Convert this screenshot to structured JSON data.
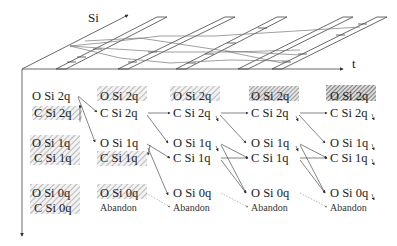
{
  "axes": {
    "vertical_top_label": "Si",
    "horizontal_label": "t"
  },
  "colors": {
    "line": "#333333",
    "hatch": "#9a9a9a",
    "hatch_dense": "#555555",
    "text": "#222222"
  },
  "columns": [
    {
      "index": 0,
      "row_2q": {
        "o": "O Si 2q",
        "c": "C Si 2q",
        "o_hatched": false,
        "c_hatched": true
      },
      "row_1q": {
        "o": "O Si 1q",
        "c": "C Si 1q",
        "o_hatched": true,
        "c_hatched": true
      },
      "row_0q": {
        "o": "O Si 0q",
        "c": "C Si 0q",
        "o_hatched": true,
        "c_hatched": true
      }
    },
    {
      "index": 1,
      "row_2q": {
        "o": "O Si 2q",
        "c": "C Si 2q",
        "o_hatched": true,
        "c_hatched": false
      },
      "row_1q": {
        "o": "O Si 1q",
        "c": "C Si 1q",
        "o_hatched": false,
        "c_hatched": true
      },
      "row_0q": {
        "o": "O Si 0q",
        "c": "Abandon",
        "o_hatched": true,
        "c_hatched": false
      }
    },
    {
      "index": 2,
      "row_2q": {
        "o": "O Si 2q",
        "c": "C Si 2q",
        "o_hatched": true,
        "c_hatched": false
      },
      "row_1q": {
        "o": "O Si 1q",
        "c": "C Si 1q",
        "o_hatched": false,
        "c_hatched": false
      },
      "row_0q": {
        "o": "O Si 0q",
        "c": "Abandon",
        "o_hatched": false,
        "c_hatched": false
      }
    },
    {
      "index": 3,
      "row_2q": {
        "o": "O Si 2q",
        "c": "C Si 2q",
        "o_hatched": true,
        "c_hatched": false
      },
      "row_1q": {
        "o": "O Si 1q",
        "c": "C Si 1q",
        "o_hatched": false,
        "c_hatched": false
      },
      "row_0q": {
        "o": "O Si 0q",
        "c": "Abandon",
        "o_hatched": false,
        "c_hatched": false
      }
    },
    {
      "index": 4,
      "row_2q": {
        "o": "O Si 2q",
        "c": "C Si 2q",
        "o_hatched": true,
        "c_hatched": false
      },
      "row_1q": {
        "o": "O Si 1q",
        "c": "C Si 1q",
        "o_hatched": false,
        "c_hatched": false
      },
      "row_0q": {
        "o": "O Si 0q",
        "c": "Abandon",
        "o_hatched": false,
        "c_hatched": false
      }
    }
  ]
}
